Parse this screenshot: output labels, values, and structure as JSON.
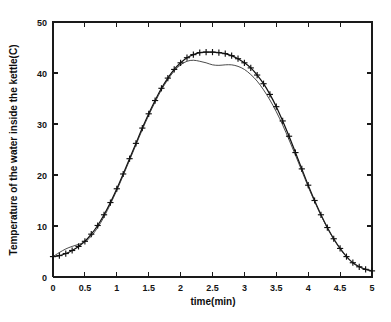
{
  "chart_data": {
    "type": "line",
    "title": "",
    "xlabel": "time(min)",
    "ylabel": "Temperature of the water inside the kettle(C)",
    "xlim": [
      0,
      5
    ],
    "ylim": [
      0,
      50
    ],
    "xticks": [
      0,
      0.5,
      1,
      1.5,
      2,
      2.5,
      3,
      3.5,
      4,
      4.5,
      5
    ],
    "xticklabels": [
      "0",
      "0.5",
      "1",
      "1.5",
      "2",
      "2.5",
      "3",
      "3.5",
      "4",
      "4.5",
      "5"
    ],
    "yticks": [
      0,
      10,
      20,
      30,
      40,
      50
    ],
    "yticklabels": [
      "0",
      "10",
      "20",
      "30",
      "40",
      "50"
    ],
    "grid": false,
    "legend": "none",
    "frame": "box",
    "series": [
      {
        "name": "measured",
        "marker": "plus",
        "linestyle": "solid",
        "x": [
          0,
          0.1,
          0.2,
          0.3,
          0.4,
          0.5,
          0.6,
          0.7,
          0.8,
          0.9,
          1,
          1.1,
          1.2,
          1.3,
          1.4,
          1.5,
          1.6,
          1.7,
          1.8,
          1.9,
          2,
          2.1,
          2.2,
          2.3,
          2.4,
          2.5,
          2.6,
          2.7,
          2.8,
          2.9,
          3,
          3.1,
          3.2,
          3.3,
          3.4,
          3.5,
          3.6,
          3.7,
          3.8,
          3.9,
          4,
          4.1,
          4.2,
          4.3,
          4.4,
          4.5,
          4.6,
          4.7,
          4.8,
          4.9,
          5
        ],
        "y": [
          4.0,
          4.2,
          4.6,
          5.2,
          6.0,
          7.0,
          8.4,
          10.1,
          12.2,
          14.6,
          17.3,
          20.2,
          23.2,
          26.2,
          29.2,
          32.0,
          34.6,
          37.0,
          39.0,
          40.7,
          42.0,
          43.0,
          43.6,
          44.0,
          44.1,
          44.1,
          44.0,
          43.8,
          43.4,
          42.8,
          42.0,
          41.0,
          39.6,
          37.9,
          35.8,
          33.4,
          30.6,
          27.6,
          24.4,
          21.2,
          18.0,
          15.0,
          12.2,
          9.7,
          7.5,
          5.6,
          4.0,
          2.8,
          2.0,
          1.5,
          1.2
        ]
      },
      {
        "name": "model",
        "marker": "none",
        "linestyle": "solid",
        "x": [
          0,
          0.1,
          0.2,
          0.3,
          0.4,
          0.5,
          0.6,
          0.7,
          0.8,
          0.9,
          1,
          1.1,
          1.2,
          1.3,
          1.4,
          1.5,
          1.6,
          1.7,
          1.8,
          1.9,
          2,
          2.1,
          2.2,
          2.3,
          2.4,
          2.5,
          2.6,
          2.7,
          2.8,
          2.9,
          3,
          3.1,
          3.2,
          3.3,
          3.4,
          3.5,
          3.6,
          3.7,
          3.8,
          3.9,
          4,
          4.1,
          4.2,
          4.3,
          4.4,
          4.5,
          4.6,
          4.7,
          4.8,
          4.9,
          5
        ],
        "y": [
          4.0,
          4.8,
          5.5,
          6.0,
          6.4,
          6.9,
          8.0,
          9.7,
          11.8,
          14.3,
          17.0,
          19.9,
          22.9,
          25.9,
          28.9,
          31.7,
          34.3,
          36.7,
          38.7,
          40.4,
          41.6,
          42.3,
          42.5,
          42.3,
          42.0,
          41.6,
          41.5,
          41.6,
          41.6,
          41.3,
          40.7,
          39.7,
          38.4,
          36.7,
          34.7,
          32.4,
          29.8,
          26.9,
          23.9,
          20.8,
          17.7,
          14.8,
          12.1,
          9.6,
          7.4,
          5.5,
          4.0,
          2.8,
          2.0,
          1.5,
          1.2
        ]
      }
    ]
  }
}
